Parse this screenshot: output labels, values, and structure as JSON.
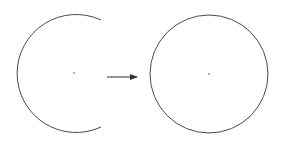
{
  "diagram": {
    "colors": {
      "stroke": "#4a4a4a",
      "background": "#ffffff"
    },
    "left_shape": {
      "type": "open-arc",
      "center": [
        74,
        73
      ],
      "radius": 59,
      "gap_side": "right"
    },
    "arrow": {
      "from": [
        107,
        77
      ],
      "to": [
        137,
        77
      ],
      "direction": "right"
    },
    "right_shape": {
      "type": "circle",
      "center": [
        209,
        74
      ],
      "radius": 59
    }
  }
}
